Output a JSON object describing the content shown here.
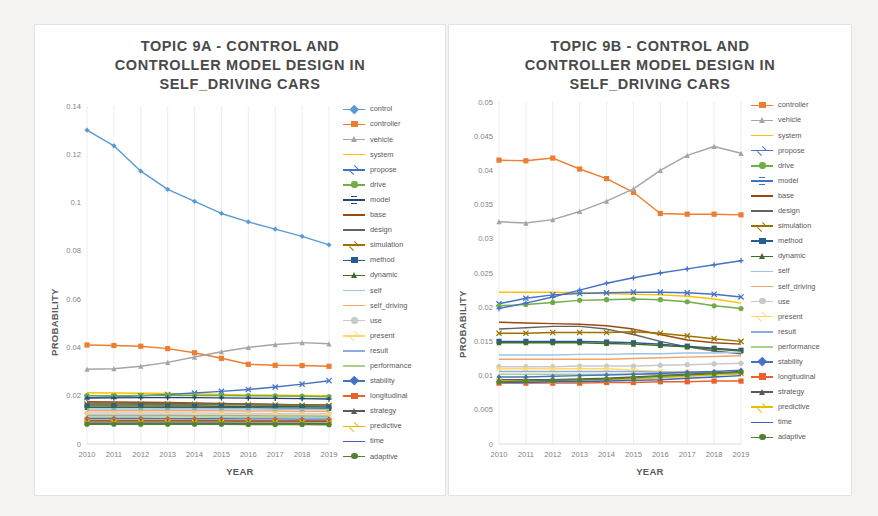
{
  "page": {
    "background": "#f4f3f1",
    "panel_background": "#ffffff"
  },
  "charts": [
    {
      "id": "topic-9a",
      "title": "TOPIC 9A - CONTROL AND\nCONTROLLER MODEL DESIGN IN\nSELF_DRIVING CARS"
    },
    {
      "id": "topic-9b",
      "title": "TOPIC 9B - CONTROL AND\nCONTROLLER MODEL DESIGN IN\nSELF_DRIVING CARS"
    }
  ],
  "chart_data": [
    {
      "id": "topic-9a",
      "type": "line",
      "title": "TOPIC 9A - CONTROL AND CONTROLLER MODEL DESIGN IN SELF_DRIVING CARS",
      "xlabel": "YEAR",
      "ylabel": "PROBABILITY",
      "x": [
        2010,
        2011,
        2012,
        2013,
        2014,
        2015,
        2016,
        2017,
        2018,
        2019
      ],
      "xtick_labels": [
        "2010",
        "2011",
        "2012",
        "2013",
        "2014",
        "2015",
        "2016",
        "2017",
        "2018",
        "2019"
      ],
      "ylim": [
        0,
        0.14
      ],
      "ytick_labels": [
        "0",
        "0.02",
        "0.04",
        "0.06",
        "0.08",
        "0.1",
        "0.12",
        "0.14"
      ],
      "yticks": [
        0,
        0.02,
        0.04,
        0.06,
        0.08,
        0.1,
        0.12,
        0.14
      ],
      "grid": "vertical",
      "legend_position": "right",
      "series": [
        {
          "name": "control",
          "color": "#5B9BD5",
          "marker": "diamond",
          "values": [
            0.13,
            0.1235,
            0.113,
            0.1055,
            0.1005,
            0.0955,
            0.092,
            0.089,
            0.086,
            0.0825
          ]
        },
        {
          "name": "controller",
          "color": "#ED7D31",
          "marker": "square",
          "values": [
            0.041,
            0.0408,
            0.0405,
            0.0395,
            0.0378,
            0.0355,
            0.033,
            0.0326,
            0.0325,
            0.0322
          ]
        },
        {
          "name": "vehicle",
          "color": "#A5A5A5",
          "marker": "triangle",
          "values": [
            0.031,
            0.0312,
            0.0322,
            0.0338,
            0.036,
            0.0382,
            0.04,
            0.0412,
            0.042,
            0.0415
          ]
        },
        {
          "name": "system",
          "color": "#FFC000",
          "marker": "line",
          "values": [
            0.0212,
            0.0211,
            0.021,
            0.0209,
            0.0207,
            0.0205,
            0.0203,
            0.0202,
            0.0201,
            0.02
          ]
        },
        {
          "name": "propose",
          "color": "#4472C4",
          "marker": "cross",
          "values": [
            0.0192,
            0.0196,
            0.02,
            0.0205,
            0.0211,
            0.0218,
            0.0226,
            0.0236,
            0.0248,
            0.0262
          ]
        },
        {
          "name": "drive",
          "color": "#70AD47",
          "marker": "circle",
          "values": [
            0.02,
            0.02,
            0.0201,
            0.0201,
            0.0201,
            0.0201,
            0.02,
            0.0199,
            0.0198,
            0.0196
          ]
        },
        {
          "name": "model",
          "color": "#264478",
          "marker": "plus",
          "values": [
            0.019,
            0.0191,
            0.0192,
            0.0192,
            0.0192,
            0.0191,
            0.019,
            0.0189,
            0.0188,
            0.0186
          ]
        },
        {
          "name": "base",
          "color": "#9E480E",
          "marker": "line",
          "values": [
            0.0175,
            0.0174,
            0.0173,
            0.0172,
            0.017,
            0.0168,
            0.0166,
            0.0164,
            0.0162,
            0.016
          ]
        },
        {
          "name": "design",
          "color": "#636363",
          "marker": "line",
          "values": [
            0.017,
            0.017,
            0.0169,
            0.0168,
            0.0167,
            0.0166,
            0.0165,
            0.0164,
            0.0163,
            0.0162
          ]
        },
        {
          "name": "simulation",
          "color": "#997300",
          "marker": "cross",
          "values": [
            0.0165,
            0.0165,
            0.0165,
            0.0165,
            0.0164,
            0.0163,
            0.0162,
            0.0161,
            0.016,
            0.0159
          ]
        },
        {
          "name": "method",
          "color": "#255E91",
          "marker": "square",
          "values": [
            0.0158,
            0.0158,
            0.0158,
            0.0157,
            0.0157,
            0.0156,
            0.0155,
            0.0155,
            0.0154,
            0.0153
          ]
        },
        {
          "name": "dynamic",
          "color": "#43682B",
          "marker": "triangle",
          "values": [
            0.0152,
            0.0152,
            0.0152,
            0.0151,
            0.0151,
            0.015,
            0.015,
            0.0149,
            0.0148,
            0.0147
          ]
        },
        {
          "name": "self",
          "color": "#9DC3E6",
          "marker": "line",
          "values": [
            0.0145,
            0.0145,
            0.0145,
            0.0145,
            0.0145,
            0.0145,
            0.0145,
            0.0144,
            0.0144,
            0.0143
          ]
        },
        {
          "name": "self_driving",
          "color": "#F4A36A",
          "marker": "line",
          "values": [
            0.0138,
            0.0138,
            0.0138,
            0.0138,
            0.0138,
            0.0138,
            0.0137,
            0.0137,
            0.0136,
            0.0136
          ]
        },
        {
          "name": "use",
          "color": "#C9C9C9",
          "marker": "circle",
          "values": [
            0.0128,
            0.0128,
            0.0128,
            0.0128,
            0.0128,
            0.0127,
            0.0127,
            0.0126,
            0.0126,
            0.0125
          ]
        },
        {
          "name": "present",
          "color": "#FFD966",
          "marker": "cross",
          "values": [
            0.0122,
            0.0122,
            0.0122,
            0.0122,
            0.0122,
            0.0121,
            0.0121,
            0.0121,
            0.012,
            0.012
          ]
        },
        {
          "name": "result",
          "color": "#8FAADC",
          "marker": "line",
          "values": [
            0.0118,
            0.0118,
            0.0118,
            0.0118,
            0.0117,
            0.0117,
            0.0117,
            0.0116,
            0.0116,
            0.0115
          ]
        },
        {
          "name": "performance",
          "color": "#A9D18E",
          "marker": "line",
          "values": [
            0.0112,
            0.0112,
            0.0112,
            0.0112,
            0.0112,
            0.0111,
            0.0111,
            0.0111,
            0.011,
            0.011
          ]
        },
        {
          "name": "stability",
          "color": "#4472C4",
          "marker": "diamond",
          "values": [
            0.0106,
            0.0106,
            0.0106,
            0.0105,
            0.0105,
            0.0105,
            0.0104,
            0.0104,
            0.0103,
            0.0103
          ]
        },
        {
          "name": "longitudinal",
          "color": "#E8622A",
          "marker": "square",
          "values": [
            0.0098,
            0.0098,
            0.0098,
            0.0098,
            0.0098,
            0.0097,
            0.0097,
            0.0097,
            0.0096,
            0.0096
          ]
        },
        {
          "name": "strategy",
          "color": "#595959",
          "marker": "triangle",
          "values": [
            0.0094,
            0.0094,
            0.0094,
            0.0094,
            0.0094,
            0.0094,
            0.0093,
            0.0093,
            0.0093,
            0.0092
          ]
        },
        {
          "name": "predictive",
          "color": "#E0C000",
          "marker": "cross",
          "values": [
            0.009,
            0.009,
            0.009,
            0.009,
            0.009,
            0.009,
            0.0089,
            0.0089,
            0.0089,
            0.0088
          ]
        },
        {
          "name": "time",
          "color": "#3A62C4",
          "marker": "line",
          "values": [
            0.0086,
            0.0086,
            0.0086,
            0.0086,
            0.0086,
            0.0086,
            0.0085,
            0.0085,
            0.0085,
            0.0084
          ]
        },
        {
          "name": "adaptive",
          "color": "#548235",
          "marker": "circle",
          "values": [
            0.0082,
            0.0082,
            0.0082,
            0.0082,
            0.0082,
            0.0082,
            0.0081,
            0.0081,
            0.0081,
            0.008
          ]
        }
      ]
    },
    {
      "id": "topic-9b",
      "type": "line",
      "title": "TOPIC 9B - CONTROL AND CONTROLLER MODEL DESIGN IN SELF_DRIVING CARS",
      "xlabel": "YEAR",
      "ylabel": "PROBABILITY",
      "x": [
        2010,
        2011,
        2012,
        2013,
        2014,
        2015,
        2016,
        2017,
        2018,
        2019
      ],
      "xtick_labels": [
        "2010",
        "2011",
        "2012",
        "2013",
        "2014",
        "2015",
        "2016",
        "2017",
        "2018",
        "2019"
      ],
      "ylim": [
        0,
        0.05
      ],
      "ytick_labels": [
        "0",
        "0.005",
        "0.01",
        "0.015",
        "0.02",
        "0.025",
        "0.03",
        "0.035",
        "0.04",
        "0.045",
        "0.05"
      ],
      "yticks": [
        0,
        0.005,
        0.01,
        0.015,
        0.02,
        0.025,
        0.03,
        0.035,
        0.04,
        0.045,
        0.05
      ],
      "grid": "vertical",
      "legend_position": "right",
      "series": [
        {
          "name": "controller",
          "color": "#ED7D31",
          "marker": "square",
          "values": [
            0.0415,
            0.0414,
            0.0418,
            0.0402,
            0.0388,
            0.0368,
            0.0337,
            0.0336,
            0.0336,
            0.0335
          ]
        },
        {
          "name": "vehicle",
          "color": "#A5A5A5",
          "marker": "triangle",
          "values": [
            0.0325,
            0.0323,
            0.0328,
            0.034,
            0.0355,
            0.0373,
            0.04,
            0.0422,
            0.0435,
            0.0425
          ]
        },
        {
          "name": "system",
          "color": "#FFC000",
          "marker": "line",
          "values": [
            0.0222,
            0.0222,
            0.0222,
            0.0221,
            0.022,
            0.0219,
            0.0218,
            0.0216,
            0.0212,
            0.0206
          ]
        },
        {
          "name": "propose",
          "color": "#4472C4",
          "marker": "cross",
          "values": [
            0.0205,
            0.0213,
            0.0218,
            0.022,
            0.0221,
            0.0222,
            0.0222,
            0.0221,
            0.0219,
            0.0215
          ]
        },
        {
          "name": "drive",
          "color": "#70AD47",
          "marker": "circle",
          "values": [
            0.0202,
            0.0204,
            0.0207,
            0.021,
            0.0211,
            0.0212,
            0.0211,
            0.0208,
            0.0202,
            0.0198
          ]
        },
        {
          "name": "model",
          "color": "#4472C4",
          "marker": "plus",
          "values": [
            0.0198,
            0.0206,
            0.0215,
            0.0225,
            0.0235,
            0.0243,
            0.025,
            0.0256,
            0.0262,
            0.0268
          ]
        },
        {
          "name": "base",
          "color": "#9E480E",
          "marker": "line",
          "values": [
            0.0178,
            0.0177,
            0.0176,
            0.0175,
            0.0173,
            0.0168,
            0.016,
            0.0152,
            0.0148,
            0.0146
          ]
        },
        {
          "name": "design",
          "color": "#636363",
          "marker": "line",
          "values": [
            0.0168,
            0.017,
            0.0172,
            0.0172,
            0.0168,
            0.016,
            0.015,
            0.0142,
            0.0136,
            0.0132
          ]
        },
        {
          "name": "simulation",
          "color": "#997300",
          "marker": "cross",
          "values": [
            0.0162,
            0.0162,
            0.0163,
            0.0163,
            0.0163,
            0.0164,
            0.0162,
            0.0158,
            0.0154,
            0.015
          ]
        },
        {
          "name": "method",
          "color": "#255E91",
          "marker": "square",
          "values": [
            0.015,
            0.015,
            0.015,
            0.015,
            0.0149,
            0.0148,
            0.0146,
            0.0143,
            0.014,
            0.0137
          ]
        },
        {
          "name": "dynamic",
          "color": "#43682B",
          "marker": "triangle",
          "values": [
            0.0148,
            0.0148,
            0.0148,
            0.0148,
            0.0147,
            0.0146,
            0.0144,
            0.0142,
            0.0139,
            0.0136
          ]
        },
        {
          "name": "self",
          "color": "#9DC3E6",
          "marker": "line",
          "values": [
            0.013,
            0.013,
            0.013,
            0.0131,
            0.0131,
            0.0132,
            0.0132,
            0.0133,
            0.0133,
            0.0134
          ]
        },
        {
          "name": "self_driving",
          "color": "#F4A36A",
          "marker": "line",
          "values": [
            0.0124,
            0.0124,
            0.0124,
            0.0124,
            0.0124,
            0.0125,
            0.0126,
            0.0127,
            0.0128,
            0.0129
          ]
        },
        {
          "name": "use",
          "color": "#C9C9C9",
          "marker": "circle",
          "values": [
            0.0113,
            0.0113,
            0.0113,
            0.0114,
            0.0114,
            0.0114,
            0.0115,
            0.0116,
            0.0117,
            0.0118
          ]
        },
        {
          "name": "present",
          "color": "#FFD966",
          "marker": "cross",
          "values": [
            0.011,
            0.011,
            0.011,
            0.011,
            0.011,
            0.0108,
            0.0106,
            0.0105,
            0.0104,
            0.0104
          ]
        },
        {
          "name": "result",
          "color": "#8FAADC",
          "marker": "line",
          "values": [
            0.0106,
            0.0106,
            0.0106,
            0.0106,
            0.0106,
            0.0106,
            0.0105,
            0.0105,
            0.0104,
            0.0104
          ]
        },
        {
          "name": "performance",
          "color": "#A9D18E",
          "marker": "line",
          "values": [
            0.0102,
            0.0102,
            0.0102,
            0.0102,
            0.0102,
            0.0102,
            0.0102,
            0.0102,
            0.0102,
            0.0102
          ]
        },
        {
          "name": "stability",
          "color": "#4472C4",
          "marker": "diamond",
          "values": [
            0.0098,
            0.0098,
            0.0099,
            0.01,
            0.0101,
            0.0102,
            0.0103,
            0.0105,
            0.0106,
            0.0108
          ]
        },
        {
          "name": "longitudinal",
          "color": "#E8622A",
          "marker": "square",
          "values": [
            0.0089,
            0.0089,
            0.0089,
            0.0089,
            0.009,
            0.009,
            0.0091,
            0.0091,
            0.0092,
            0.0092
          ]
        },
        {
          "name": "strategy",
          "color": "#595959",
          "marker": "triangle",
          "values": [
            0.0094,
            0.0094,
            0.0094,
            0.0095,
            0.0096,
            0.0098,
            0.01,
            0.0102,
            0.0104,
            0.0106
          ]
        },
        {
          "name": "predictive",
          "color": "#E0C000",
          "marker": "cross",
          "values": [
            0.0092,
            0.0092,
            0.0092,
            0.0093,
            0.0094,
            0.0095,
            0.0097,
            0.0099,
            0.0101,
            0.0103
          ]
        },
        {
          "name": "time",
          "color": "#3A62C4",
          "marker": "line",
          "values": [
            0.009,
            0.009,
            0.0091,
            0.0091,
            0.0092,
            0.0093,
            0.0094,
            0.0096,
            0.0098,
            0.01
          ]
        },
        {
          "name": "adaptive",
          "color": "#548235",
          "marker": "circle",
          "values": [
            0.0091,
            0.0092,
            0.0093,
            0.0094,
            0.0095,
            0.0097,
            0.0099,
            0.0101,
            0.0103,
            0.0105
          ]
        }
      ]
    }
  ]
}
